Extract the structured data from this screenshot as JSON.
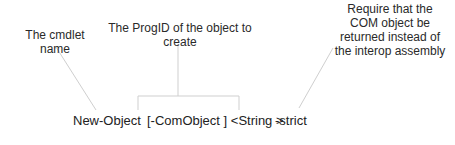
{
  "annotations": {
    "cmdlet": "The cmdlet name",
    "progid_line1": "The ProgID of the object to",
    "progid_line2": "create",
    "strict_line1": "Require that the",
    "strict_line2": "COM object be",
    "strict_line3": "returned instead of",
    "strict_line4": "the interop assembly"
  },
  "syntax": {
    "cmdlet": "New-Object",
    "param": "[-ComObject ] <String >",
    "switch": "-strict"
  },
  "colors": {
    "line": "#cfcfcf",
    "text": "#222222"
  }
}
